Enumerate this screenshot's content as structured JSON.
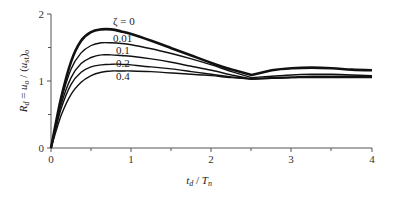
{
  "chart_data": {
    "type": "line",
    "title": "",
    "xlabel": "t_d / T_n",
    "ylabel": "R_d = u_o / (u_st)_o",
    "xlim": [
      0,
      4
    ],
    "ylim": [
      0,
      2
    ],
    "x_ticks": [
      "0",
      "1",
      "2",
      "3",
      "4"
    ],
    "y_ticks": [
      "0",
      "1",
      "2"
    ],
    "grid": false,
    "legend_position": "inline labels near peaks",
    "x": [
      0,
      0.125,
      0.25,
      0.375,
      0.5,
      0.625,
      0.75,
      0.875,
      1.0,
      1.25,
      1.5,
      1.75,
      2.0,
      2.25,
      2.5,
      2.75,
      3.0,
      3.25,
      3.5,
      3.75,
      4.0
    ],
    "series": [
      {
        "name": "ζ = 0",
        "label": "ζ = 0",
        "values": [
          0,
          0.74,
          1.29,
          1.6,
          1.73,
          1.77,
          1.77,
          1.74,
          1.7,
          1.6,
          1.49,
          1.38,
          1.27,
          1.17,
          1.09,
          1.16,
          1.19,
          1.2,
          1.19,
          1.17,
          1.16
        ]
      },
      {
        "name": "ζ = 0.01",
        "label": "0.01",
        "values": [
          0,
          0.7,
          1.18,
          1.42,
          1.53,
          1.57,
          1.57,
          1.56,
          1.54,
          1.48,
          1.41,
          1.33,
          1.24,
          1.14,
          1.05,
          1.07,
          1.09,
          1.1,
          1.1,
          1.09,
          1.08
        ]
      },
      {
        "name": "ζ = 0.1",
        "label": "0.1",
        "values": [
          0,
          0.64,
          1.05,
          1.26,
          1.35,
          1.39,
          1.39,
          1.38,
          1.37,
          1.33,
          1.28,
          1.22,
          1.16,
          1.09,
          1.03,
          1.05,
          1.06,
          1.07,
          1.07,
          1.07,
          1.07
        ]
      },
      {
        "name": "ζ = 0.2",
        "label": "0.2",
        "values": [
          0,
          0.58,
          0.95,
          1.13,
          1.21,
          1.24,
          1.25,
          1.25,
          1.24,
          1.21,
          1.18,
          1.14,
          1.1,
          1.06,
          1.03,
          1.04,
          1.05,
          1.06,
          1.06,
          1.06,
          1.06
        ]
      },
      {
        "name": "ζ = 0.4",
        "label": "0.4",
        "values": [
          0,
          0.48,
          0.8,
          0.98,
          1.08,
          1.13,
          1.15,
          1.15,
          1.15,
          1.14,
          1.12,
          1.1,
          1.08,
          1.05,
          1.03,
          1.04,
          1.05,
          1.05,
          1.05,
          1.05,
          1.05
        ]
      }
    ]
  },
  "labels": {
    "zeta0": "ζ = 0",
    "zeta001": "0.01",
    "zeta01": "0.1",
    "zeta02": "0.2",
    "zeta04": "0.4"
  },
  "axes": {
    "x_ticks": [
      "0",
      "1",
      "2",
      "3",
      "4"
    ],
    "y_ticks": [
      "0",
      "1",
      "2"
    ]
  }
}
